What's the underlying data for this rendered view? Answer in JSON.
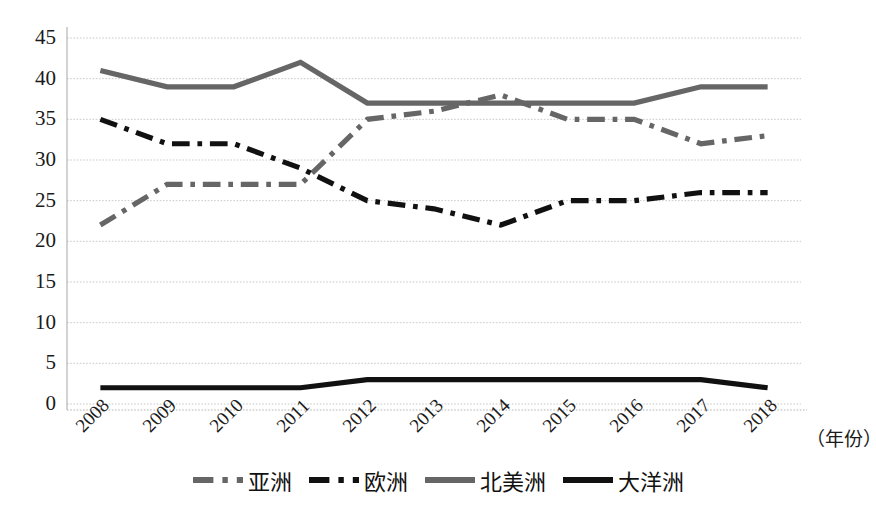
{
  "chart_data": {
    "type": "line",
    "title": "",
    "subtitle": "",
    "xlabel": "（年份）",
    "ylabel": "",
    "x": [
      2008,
      2009,
      2010,
      2011,
      2012,
      2013,
      2014,
      2015,
      2016,
      2017,
      2018
    ],
    "categories": [
      "2008",
      "2009",
      "2010",
      "2011",
      "2012",
      "2013",
      "2014",
      "2015",
      "2016",
      "2017",
      "2018"
    ],
    "xlim": [
      2008,
      2018
    ],
    "ylim": [
      0,
      45
    ],
    "y_ticks": [
      0,
      5,
      10,
      15,
      20,
      25,
      30,
      35,
      40,
      45
    ],
    "y_tick_labels": [
      "0",
      "5",
      "10",
      "15",
      "20",
      "25",
      "30",
      "35",
      "40",
      "45"
    ],
    "grid": true,
    "grid_axis": "y",
    "legend_position": "bottom",
    "series": [
      {
        "name": "亚洲",
        "color": "#666666",
        "style": "dashdot",
        "values": [
          22,
          27,
          27,
          27,
          35,
          36,
          38,
          35,
          35,
          32,
          33
        ]
      },
      {
        "name": "欧洲",
        "color": "#111111",
        "style": "dashdot",
        "values": [
          35,
          32,
          32,
          29,
          25,
          24,
          22,
          25,
          25,
          26,
          26
        ]
      },
      {
        "name": "北美洲",
        "color": "#666666",
        "style": "solid",
        "values": [
          41,
          39,
          39,
          42,
          37,
          37,
          37,
          37,
          37,
          39,
          39
        ]
      },
      {
        "name": "大洋洲",
        "color": "#111111",
        "style": "solid",
        "values": [
          2,
          2,
          2,
          2,
          3,
          3,
          3,
          3,
          3,
          3,
          2
        ]
      }
    ]
  },
  "axes": {
    "y_tick_labels": [
      "45",
      "40",
      "35",
      "30",
      "25",
      "20",
      "15",
      "10",
      "5",
      "0"
    ],
    "x_tick_labels": [
      "2008",
      "2009",
      "2010",
      "2011",
      "2012",
      "2013",
      "2014",
      "2015",
      "2016",
      "2017",
      "2018"
    ],
    "x_axis_title": "（年份）"
  },
  "legend": {
    "entries": [
      {
        "label": "亚洲"
      },
      {
        "label": "欧洲"
      },
      {
        "label": "北美洲"
      },
      {
        "label": "大洋洲"
      }
    ]
  },
  "colors": {
    "gray_series": "#666666",
    "black_series": "#111111",
    "grid": "#c9c9c9",
    "axis": "#b5b5b5",
    "text": "#1a1a1a",
    "background": "#ffffff"
  }
}
